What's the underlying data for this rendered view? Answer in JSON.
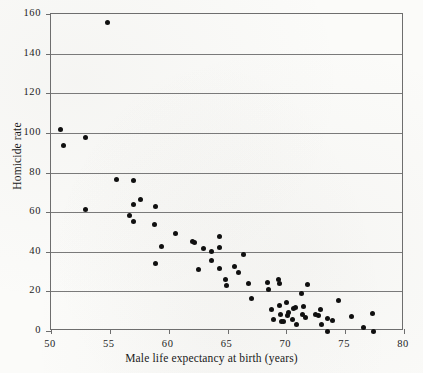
{
  "chart_data": {
    "type": "scatter",
    "title": "",
    "xlabel": "Male life expectancy at birth (years)",
    "ylabel": "Homicide rate",
    "xlim": [
      50,
      80
    ],
    "ylim": [
      0,
      160
    ],
    "xticks": [
      50,
      55,
      60,
      65,
      70,
      75,
      80
    ],
    "yticks": [
      0,
      20,
      40,
      60,
      80,
      100,
      120,
      140,
      160
    ],
    "xtick_labels": [
      "50",
      "55",
      "60",
      "65",
      "70",
      "75",
      "80"
    ],
    "ytick_labels": [
      "0",
      "20",
      "40",
      "60",
      "80",
      "100",
      "120",
      "140",
      "160"
    ],
    "grid": "horizontal",
    "legend": null,
    "marker": "filled-circle",
    "marker_color": "#101010",
    "series": [
      {
        "name": "countries",
        "points": [
          [
            54.8,
            155.5
          ],
          [
            50.8,
            101.8
          ],
          [
            51.1,
            93.5
          ],
          [
            52.9,
            97.8
          ],
          [
            52.9,
            61.5
          ],
          [
            55.6,
            76.3
          ],
          [
            57.0,
            76.0
          ],
          [
            56.7,
            58.2
          ],
          [
            57.0,
            63.8
          ],
          [
            57.0,
            55.3
          ],
          [
            57.6,
            66.5
          ],
          [
            58.9,
            62.8
          ],
          [
            58.8,
            53.7
          ],
          [
            58.9,
            34.0
          ],
          [
            59.4,
            42.9
          ],
          [
            60.6,
            49.4
          ],
          [
            62.0,
            45.0
          ],
          [
            62.2,
            44.8
          ],
          [
            62.5,
            31.2
          ],
          [
            63.0,
            41.5
          ],
          [
            63.6,
            40.2
          ],
          [
            63.6,
            35.5
          ],
          [
            64.3,
            47.8
          ],
          [
            64.3,
            41.9
          ],
          [
            64.3,
            31.6
          ],
          [
            64.8,
            26.0
          ],
          [
            64.9,
            23.2
          ],
          [
            65.6,
            32.4
          ],
          [
            65.9,
            29.3
          ],
          [
            66.4,
            38.6
          ],
          [
            66.8,
            24.2
          ],
          [
            67.0,
            16.6
          ],
          [
            68.4,
            24.4
          ],
          [
            68.5,
            20.7
          ],
          [
            68.7,
            10.8
          ],
          [
            68.9,
            5.8
          ],
          [
            69.3,
            25.8
          ],
          [
            69.4,
            24.2
          ],
          [
            69.4,
            12.7
          ],
          [
            69.5,
            8.3
          ],
          [
            69.6,
            4.6
          ],
          [
            69.8,
            4.6
          ],
          [
            70.0,
            14.6
          ],
          [
            70.1,
            8.0
          ],
          [
            70.2,
            9.2
          ],
          [
            70.5,
            5.9
          ],
          [
            70.6,
            11.6
          ],
          [
            70.8,
            12.0
          ],
          [
            70.9,
            3.5
          ],
          [
            71.3,
            19.0
          ],
          [
            71.4,
            8.3
          ],
          [
            71.5,
            12.3
          ],
          [
            71.6,
            6.8
          ],
          [
            71.8,
            23.6
          ],
          [
            72.5,
            8.2
          ],
          [
            72.7,
            7.6
          ],
          [
            72.9,
            11.0
          ],
          [
            73.0,
            3.1
          ],
          [
            73.5,
            6.2
          ],
          [
            73.5,
            0.0
          ],
          [
            73.9,
            5.4
          ],
          [
            74.4,
            15.4
          ],
          [
            75.5,
            7.3
          ],
          [
            76.6,
            1.9
          ],
          [
            77.3,
            9.0
          ],
          [
            77.4,
            0.0
          ]
        ]
      }
    ]
  }
}
